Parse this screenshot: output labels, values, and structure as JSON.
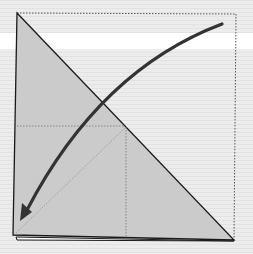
{
  "diagram": {
    "type": "origami-fold-step",
    "colors": {
      "background": "#e9e9e9",
      "stripe_band": "#ffffff",
      "paper_fill": "#cbcbcb",
      "outline": "#1a1a1a",
      "arrow": "#333333",
      "dotted_lines": "#555555"
    },
    "shapes": {
      "triangle": [
        [
          17,
          13
        ],
        [
          234,
          240
        ],
        [
          13,
          235
        ]
      ],
      "dotted_square_edges": [
        [
          17,
          13
        ],
        [
          236,
          14
        ],
        [
          234,
          240
        ]
      ],
      "crease_horizontal": [
        [
          17,
          126
        ],
        [
          125,
          126
        ]
      ],
      "crease_vertical": [
        [
          126,
          127
        ],
        [
          126,
          238
        ]
      ],
      "crease_diagonal": [
        [
          125,
          128
        ],
        [
          15,
          234
        ]
      ],
      "arrow_path": "M222,24 Q100,70 24,216"
    }
  }
}
